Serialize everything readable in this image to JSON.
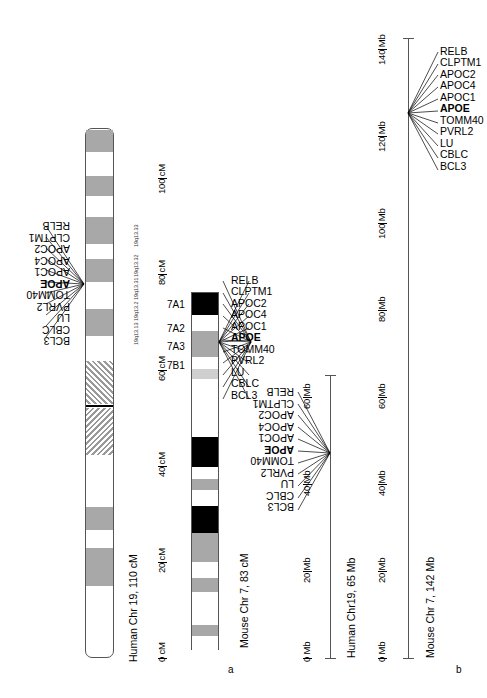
{
  "figure": {
    "panels": [
      {
        "id": "a",
        "label": "a"
      },
      {
        "id": "b",
        "label": "b"
      }
    ]
  },
  "genes": {
    "list": [
      "RELB",
      "CLPTM1",
      "APOC2",
      "APOC4",
      "APOC1",
      "APOE",
      "TOMM40",
      "PVRL2",
      "LU",
      "CBLC",
      "BCL3"
    ],
    "highlight": "APOE"
  },
  "panel_a": {
    "human": {
      "caption": "Human Chr 19, 110 cM",
      "axis_label_unit": "cM",
      "axis_ticks": [
        "0 cM",
        "20 cM",
        "40 cM",
        "60 cM",
        "80 cM",
        "100 cM"
      ],
      "axis_values": [
        0,
        20,
        40,
        60,
        80,
        100
      ],
      "axis_max": 110,
      "cytobands": [
        "19q13.33",
        "19q13.32",
        "19q13.31",
        "19q13.2",
        "19q13.13"
      ],
      "gene_anchor_cM": 80,
      "genes": [
        "RELB",
        "CLPTM1",
        "APOC2",
        "APOC4",
        "APOC1",
        "APOE",
        "TOMM40",
        "PVRL2",
        "LU",
        "CBLC",
        "BCL3"
      ]
    },
    "mouse": {
      "caption": "Mouse Chr 7, 83 cM",
      "axis_label_unit": "cM",
      "band_labels": [
        "7A1",
        "7A2",
        "7A3",
        "7B1"
      ],
      "gene_anchor_cM": 76,
      "genes": [
        "RELB",
        "CLPTM1",
        "APOC2",
        "APOC4",
        "APOC1",
        "APOE",
        "TOMM40",
        "PVRL2",
        "LU",
        "CBLC",
        "BCL3"
      ]
    }
  },
  "panel_b": {
    "human": {
      "caption": "Human Chr19, 65 Mb",
      "axis_ticks": [
        "0 Mb",
        "20 Mb",
        "40 Mb",
        "60 Mb"
      ],
      "axis_values": [
        0,
        20,
        40,
        60
      ],
      "length_mb": 65,
      "gene_anchor_mb": 50,
      "genes": [
        "RELB",
        "CLPTM1",
        "APOC2",
        "APOC4",
        "APOC1",
        "APOE",
        "TOMM40",
        "PVRL2",
        "LU",
        "CBLC",
        "BCL3"
      ]
    },
    "mouse": {
      "caption": "Mouse Chr 7, 142 Mb",
      "axis_ticks": [
        "0 Mb",
        "20 Mb",
        "40 Mb",
        "60 Mb",
        "80 Mb",
        "100 Mb",
        "120 Mb",
        "140 Mb"
      ],
      "axis_values": [
        0,
        20,
        40,
        60,
        80,
        100,
        120,
        140
      ],
      "length_mb": 142,
      "gene_anchor_mb": 122,
      "genes": [
        "RELB",
        "CLPTM1",
        "APOC2",
        "APOC4",
        "APOC1",
        "APOE",
        "TOMM40",
        "PVRL2",
        "LU",
        "CBLC",
        "BCL3"
      ]
    }
  },
  "colors": {
    "band_gray": "#a8a8a8",
    "band_black": "#000000",
    "band_light": "#cfcfcf",
    "outline": "#555555",
    "text": "#000000"
  }
}
